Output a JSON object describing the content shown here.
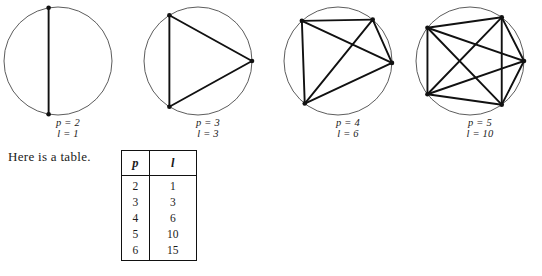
{
  "figures": [
    {
      "name": "circle-p2",
      "points": 2,
      "lines": 1,
      "p_label": "p = 2",
      "l_label": "l = 1",
      "center_x": 58,
      "center_y": 59,
      "radius": 54,
      "vertex_angles": [
        -100,
        100
      ],
      "edges": [
        [
          0,
          1
        ]
      ]
    },
    {
      "name": "circle-p3",
      "points": 3,
      "lines": 3,
      "p_label": "p = 3",
      "l_label": "l = 3",
      "center_x": 58,
      "center_y": 59,
      "radius": 54,
      "vertex_angles": [
        -122,
        0,
        122
      ],
      "edges": [
        [
          0,
          1
        ],
        [
          1,
          2
        ],
        [
          2,
          0
        ]
      ]
    },
    {
      "name": "circle-p4",
      "points": 4,
      "lines": 6,
      "p_label": "p = 4",
      "l_label": "l = 6",
      "center_x": 58,
      "center_y": 59,
      "radius": 54,
      "vertex_angles": [
        -132,
        -50,
        2,
        128
      ],
      "edges": [
        [
          0,
          1
        ],
        [
          0,
          2
        ],
        [
          0,
          3
        ],
        [
          1,
          2
        ],
        [
          1,
          3
        ],
        [
          2,
          3
        ]
      ]
    },
    {
      "name": "circle-p5",
      "points": 5,
      "lines": 10,
      "p_label": "p = 5",
      "l_label": "l = 10",
      "center_x": 58,
      "center_y": 59,
      "radius": 54,
      "vertex_angles": [
        -142,
        -54,
        0,
        54,
        142
      ],
      "edges": [
        [
          0,
          1
        ],
        [
          0,
          2
        ],
        [
          0,
          3
        ],
        [
          0,
          4
        ],
        [
          1,
          2
        ],
        [
          1,
          3
        ],
        [
          1,
          4
        ],
        [
          2,
          3
        ],
        [
          2,
          4
        ],
        [
          3,
          4
        ]
      ]
    }
  ],
  "figure_positions": [
    0,
    140,
    280,
    412
  ],
  "prose": {
    "intro": "Here is a table."
  },
  "table": {
    "headers": [
      "p",
      "l"
    ],
    "rows": [
      [
        "2",
        "1"
      ],
      [
        "3",
        "3"
      ],
      [
        "4",
        "6"
      ],
      [
        "5",
        "10"
      ],
      [
        "6",
        "15"
      ]
    ]
  },
  "style": {
    "circle_stroke": "#4a4a4a",
    "edge_stroke": "#111111",
    "vertex_fill": "#111111",
    "background": "#ffffff"
  }
}
